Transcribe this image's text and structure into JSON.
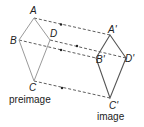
{
  "preimage": {
    "caption": "preimage",
    "color": "#9a9a9a",
    "vertices": [
      {
        "label": "A",
        "x": 34,
        "y": 18
      },
      {
        "label": "D",
        "x": 50,
        "y": 40
      },
      {
        "label": "C",
        "x": 34,
        "y": 81
      },
      {
        "label": "B",
        "x": 19,
        "y": 40
      }
    ]
  },
  "image": {
    "caption": "image",
    "color": "#555555",
    "vertices": [
      {
        "label": "A'",
        "x": 110,
        "y": 35
      },
      {
        "label": "D'",
        "x": 126,
        "y": 58
      },
      {
        "label": "C'",
        "x": 110,
        "y": 98
      },
      {
        "label": "B'",
        "x": 96,
        "y": 58
      }
    ]
  },
  "labels": {
    "A": "A",
    "B": "B",
    "C": "C",
    "D": "D",
    "A1": "A'",
    "B1": "B'",
    "C1": "C'",
    "D1": "D'"
  },
  "arrow_color": "#333333"
}
